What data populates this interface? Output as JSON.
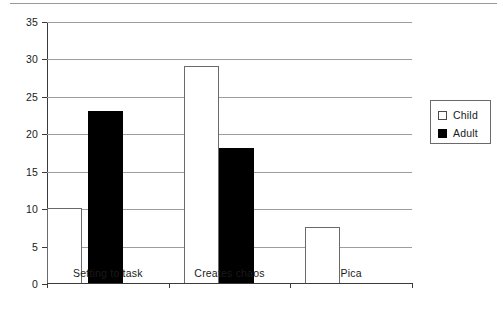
{
  "chart_data": {
    "type": "bar",
    "title": "",
    "xlabel": "",
    "ylabel": "",
    "categories": [
      "Setting to task",
      "Creates chaos",
      "Pica"
    ],
    "series": [
      {
        "name": "Child",
        "values": [
          10,
          29,
          7.5
        ],
        "color": "#ffffff"
      },
      {
        "name": "Adult",
        "values": [
          23,
          18,
          0
        ],
        "color": "#000000"
      }
    ],
    "ylim": [
      0,
      35
    ],
    "ytick_values": [
      0,
      5,
      10,
      15,
      20,
      25,
      30,
      35
    ],
    "ytick_labels": [
      "0",
      "5",
      "10",
      "15",
      "20",
      "25",
      "30",
      "35"
    ],
    "grid": "horizontal",
    "legend_position": "right"
  },
  "legend": {
    "entries": [
      {
        "label": "Child",
        "swatch": "white-square-outline"
      },
      {
        "label": "Adult",
        "swatch": "black-square-filled"
      }
    ]
  }
}
